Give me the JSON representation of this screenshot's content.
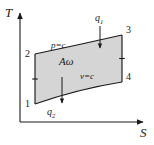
{
  "figure": {
    "type": "thermodynamic-ts-diagram",
    "background_color": "#ffffff",
    "stroke_color": "#1a1a1a",
    "fill_color": "#d5d5d5"
  },
  "axes": {
    "y_label": "T",
    "x_label": "S",
    "origin": {
      "x": 20,
      "y": 122
    },
    "y_top": 10,
    "x_right": 146
  },
  "corners": {
    "c1": {
      "label": "1",
      "x": 35,
      "y": 104
    },
    "c2": {
      "label": "2",
      "x": 35,
      "y": 54
    },
    "c3": {
      "label": "3",
      "x": 122,
      "y": 35
    },
    "c4": {
      "label": "4",
      "x": 122,
      "y": 82
    }
  },
  "curves": {
    "top": {
      "label": "p",
      "equals": "=",
      "value": "c"
    },
    "bottom": {
      "label": "v",
      "equals": "=",
      "value": "c"
    }
  },
  "area": {
    "label": "A",
    "symbol": "ω"
  },
  "heat": {
    "input": {
      "label": "q",
      "subscript": "1"
    },
    "output": {
      "label": "q",
      "subscript": "2"
    }
  }
}
